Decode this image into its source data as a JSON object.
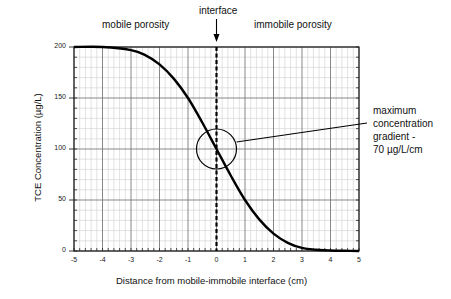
{
  "chart_data": {
    "type": "line",
    "title": "",
    "xlabel": "Distance from mobile-immobile interface (cm)",
    "ylabel": "TCE Concentration (µg/L)",
    "xlim": [
      -5,
      5
    ],
    "ylim": [
      0,
      200
    ],
    "x_ticks": [
      "-5",
      "-4",
      "-3",
      "-2",
      "-1",
      "0",
      "1",
      "2",
      "3",
      "4",
      "5"
    ],
    "y_ticks": [
      "0",
      "50",
      "100",
      "150",
      "200"
    ],
    "grid": {
      "major_x": 1,
      "minor_x": 0.2,
      "major_y": 50,
      "minor_y": 10
    },
    "series": [
      {
        "name": "TCE concentration profile",
        "x": [
          -5,
          -4,
          -3,
          -2.5,
          -2,
          -1.5,
          -1,
          -0.5,
          0,
          0.5,
          1,
          1.5,
          2,
          2.5,
          3,
          3.5,
          4,
          4.5,
          5
        ],
        "y": [
          200,
          200,
          197,
          192,
          183,
          169,
          150,
          126,
          100,
          74,
          50,
          31,
          17,
          8,
          3,
          1.2,
          0.5,
          0.2,
          0
        ]
      }
    ],
    "annotations": {
      "interface_label": "interface",
      "interface_x": 0,
      "left_region": "mobile porosity",
      "right_region": "immobile porosity",
      "gradient_note": [
        "maximum",
        "concentration",
        "gradient -",
        "70 µg/L/cm"
      ],
      "circle_center": [
        0,
        100
      ]
    },
    "legend": "none"
  }
}
